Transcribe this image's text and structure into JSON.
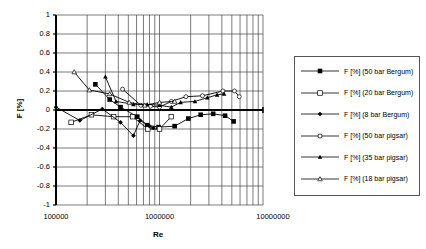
{
  "chart_data": {
    "type": "line",
    "title": "",
    "xlabel": "Re",
    "ylabel": "F [%]",
    "xscale": "log",
    "xlim": [
      100000,
      10000000
    ],
    "ylim": [
      -1,
      1
    ],
    "yticks": [
      "1",
      "0.8",
      "0.6",
      "0.4",
      "0.2",
      "0",
      "-0.2",
      "-0.4",
      "-0.6",
      "-0.8",
      "-1"
    ],
    "xticks": [
      "100000",
      "1000000",
      "10000000"
    ],
    "grid": true,
    "legend_position": "right",
    "series": [
      {
        "name": "F [%] (50 bar Bergum)",
        "marker": "filled-square",
        "x": [
          240000,
          330000,
          420000,
          610000,
          760000,
          980000,
          1400000,
          1900000,
          2500000,
          3300000,
          4300000,
          5200000
        ],
        "y": [
          0.27,
          0.11,
          0.03,
          -0.07,
          -0.16,
          -0.18,
          -0.17,
          -0.09,
          -0.05,
          -0.04,
          -0.06,
          -0.12
        ]
      },
      {
        "name": "F [%] (20 bar Bergum)",
        "marker": "open-square",
        "x": [
          140000,
          220000,
          360000,
          550000,
          770000,
          1000000,
          1300000
        ],
        "y": [
          -0.13,
          -0.05,
          -0.07,
          -0.07,
          -0.2,
          -0.2,
          -0.07
        ]
      },
      {
        "name": "F [%] (8 bar Bergum)",
        "marker": "filled-diamond",
        "x": [
          100000,
          170000,
          280000,
          420000,
          560000,
          650000,
          800000,
          870000
        ],
        "y": [
          0.03,
          -0.11,
          0.01,
          -0.13,
          -0.27,
          -0.11,
          -0.17,
          -0.19
        ]
      },
      {
        "name": "F [%] (50 bar pigsar)",
        "marker": "open-circle",
        "x": [
          440000,
          660000,
          820000,
          1000000,
          1300000,
          1800000,
          2600000,
          4100000,
          5300000,
          5900000
        ],
        "y": [
          0.22,
          0.05,
          0.04,
          0.03,
          0.09,
          0.14,
          0.15,
          0.2,
          0.2,
          0.14
        ]
      },
      {
        "name": "F [%] (35 bar pigsar)",
        "marker": "filled-triangle",
        "x": [
          300000,
          380000,
          560000,
          760000,
          1000000,
          1300000,
          1600000,
          2200000,
          2900000,
          3600000,
          4200000
        ],
        "y": [
          0.35,
          0.09,
          0.06,
          0.06,
          0.05,
          0.03,
          0.08,
          0.09,
          0.13,
          0.16,
          0.17
        ]
      },
      {
        "name": "F [%] (18 bar pigsar)",
        "marker": "open-triangle",
        "x": [
          150000,
          210000,
          330000,
          510000,
          720000,
          1000000,
          1400000
        ],
        "y": [
          0.4,
          0.21,
          0.17,
          0.08,
          0.05,
          0.08,
          0.09
        ]
      }
    ]
  }
}
